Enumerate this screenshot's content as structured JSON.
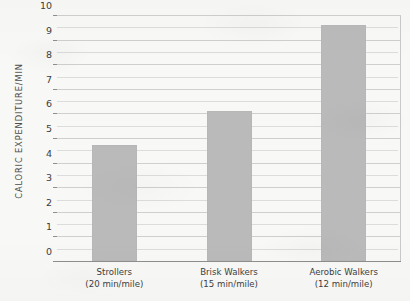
{
  "chart_data": {
    "type": "bar",
    "title": "",
    "xlabel": "",
    "ylabel": "CALORIC EXPENDITURE/MIN",
    "ylim": [
      0,
      10
    ],
    "ytick_step": 1,
    "yminor_step": 0.5,
    "grid": true,
    "legend": null,
    "categories": [
      "Strollers\n(20 min/mile)",
      "Brisk Walkers\n(15 min/mile)",
      "Aerobic Walkers\n(12 min/mile)"
    ],
    "category_names": [
      "Strollers",
      "Brisk Walkers",
      "Aerobic Walkers"
    ],
    "category_paces": [
      "(20 min/mile)",
      "(15 min/mile)",
      "(12 min/mile)"
    ],
    "values": [
      4.7,
      6.1,
      9.6
    ],
    "ytick_labels": [
      "0",
      "1",
      "2",
      "3",
      "4",
      "5",
      "6",
      "7",
      "8",
      "9",
      "10"
    ],
    "bar_color": "#bababa",
    "grid_color": "#cfcfcf",
    "axis_color": "#8e8e8e",
    "background_color": "#f8f8f6"
  },
  "axes": {
    "y_title": "CALORIC EXPENDITURE/MIN"
  }
}
